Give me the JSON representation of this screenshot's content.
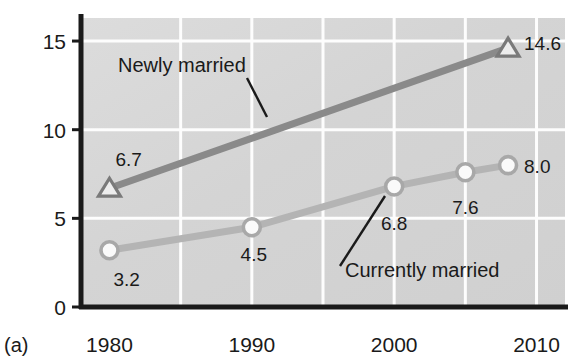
{
  "figure": {
    "caption": "(a)",
    "background": "#d6d6d6",
    "grid_color": "#fdfdfd",
    "axis_color": "#1a1a1a"
  },
  "chart_data": {
    "type": "line",
    "title": "",
    "xlabel": "",
    "ylabel": "",
    "xlim": [
      1978,
      2012
    ],
    "ylim": [
      0,
      16.3
    ],
    "xticks": [
      "1980",
      "1990",
      "2000",
      "2010"
    ],
    "xtick_values": [
      1980,
      1990,
      2000,
      2010
    ],
    "yticks": [
      "0",
      "5",
      "10",
      "15"
    ],
    "ytick_values": [
      0,
      5,
      10,
      15
    ],
    "grid": true,
    "gridlines_x": [
      1985,
      1990,
      1995,
      2000,
      2005,
      2010
    ],
    "gridlines_y": [
      5,
      10,
      15
    ],
    "legend": "inline-annotations",
    "series": [
      {
        "name": "Newly married",
        "label": "Newly married",
        "color": "#8a8a8a",
        "marker": "triangle",
        "x": [
          1980,
          2008
        ],
        "values": [
          6.7,
          14.6
        ],
        "point_labels": [
          "6.7",
          "14.6"
        ]
      },
      {
        "name": "Currently married",
        "label": "Currently married",
        "color": "#b4b4b4",
        "marker": "circle",
        "x": [
          1980,
          1990,
          2000,
          2005,
          2008
        ],
        "values": [
          3.2,
          4.5,
          6.8,
          7.6,
          8.0
        ],
        "point_labels": [
          "3.2",
          "4.5",
          "6.8",
          "7.6",
          "8.0"
        ]
      }
    ]
  }
}
